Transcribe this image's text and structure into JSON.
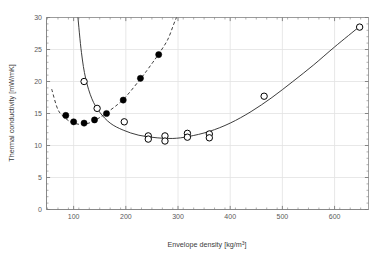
{
  "figure": {
    "background": "#ffffff",
    "plot_background": "#ffffff",
    "axis_color": "#7a7a7a",
    "grid_color": "#e2e2e2",
    "marker_color": "#000000",
    "curve_color": "#333333"
  },
  "axes": {
    "x_label_main": "Envelope density [kg/m",
    "x_label_sup": "3",
    "x_label_tail": "]",
    "x_label_full": "Envelope density [kg/m3]",
    "y_label": "Thermal conductivity [mW/mK]",
    "x_ticks": [
      100,
      200,
      300,
      400,
      500,
      600
    ],
    "x_tick_labels": [
      "100",
      "200",
      "300",
      "400",
      "500",
      "600"
    ],
    "y_ticks": [
      0,
      5,
      10,
      15,
      20,
      25,
      30
    ],
    "y_tick_labels": [
      "0",
      "5",
      "10",
      "15",
      "20",
      "25",
      "30"
    ],
    "xlim": [
      48,
      665
    ],
    "ylim": [
      0,
      30
    ],
    "grid": true,
    "minor_ticks": true
  },
  "chart_data": {
    "type": "scatter",
    "title": "",
    "xlabel": "Envelope density [kg/m3]",
    "ylabel": "Thermal conductivity [mW/mK]",
    "xlim": [
      48,
      665
    ],
    "ylim": [
      0,
      30
    ],
    "grid": true,
    "legend": null,
    "series": [
      {
        "name": "filled-circles",
        "marker": "filled-circle",
        "marker_size": 6.2,
        "color": "#000000",
        "line_style": "dashed",
        "x": [
          85,
          100,
          120,
          140,
          163,
          195,
          228,
          263
        ],
        "y": [
          14.7,
          13.7,
          13.5,
          14.0,
          15.0,
          17.1,
          20.5,
          24.2
        ]
      },
      {
        "name": "open-circles",
        "marker": "open-circle",
        "marker_size": 6.4,
        "color": "#000000",
        "line_style": "solid",
        "x": [
          120,
          145,
          197,
          243,
          243,
          275,
          275,
          318,
          318,
          360,
          360,
          465,
          648
        ],
        "y": [
          20.0,
          15.8,
          13.7,
          11.5,
          11.0,
          11.5,
          10.7,
          11.9,
          11.3,
          11.8,
          11.2,
          17.7,
          28.5
        ]
      }
    ],
    "fit_curves": [
      {
        "name": "dashed-fit-upper",
        "style": "dashed",
        "description": "U-shaped dashed curve through filled circles, minimum near x=120 y=13.3, rising steeply past x=270",
        "points": [
          [
            58,
            18.8
          ],
          [
            70,
            15.6
          ],
          [
            85,
            14.2
          ],
          [
            100,
            13.5
          ],
          [
            120,
            13.3
          ],
          [
            140,
            13.9
          ],
          [
            163,
            15.1
          ],
          [
            195,
            17.2
          ],
          [
            228,
            20.4
          ],
          [
            250,
            22.8
          ],
          [
            263,
            24.3
          ],
          [
            280,
            26.5
          ],
          [
            292,
            29.0
          ],
          [
            298,
            30.2
          ]
        ]
      },
      {
        "name": "solid-fit-lower",
        "style": "solid",
        "description": "Steep decline from upper-left to broad minimum ~11 near x=290, then gradual rise to ~28.5 at x=648",
        "points": [
          [
            108,
            30.2
          ],
          [
            115,
            24.5
          ],
          [
            123,
            20.5
          ],
          [
            135,
            17.3
          ],
          [
            150,
            15.2
          ],
          [
            170,
            13.5
          ],
          [
            195,
            12.4
          ],
          [
            225,
            11.6
          ],
          [
            260,
            11.2
          ],
          [
            290,
            11.1
          ],
          [
            320,
            11.4
          ],
          [
            360,
            12.2
          ],
          [
            400,
            13.5
          ],
          [
            440,
            15.3
          ],
          [
            480,
            17.5
          ],
          [
            520,
            20.0
          ],
          [
            560,
            22.6
          ],
          [
            600,
            25.4
          ],
          [
            648,
            28.6
          ]
        ]
      }
    ]
  }
}
